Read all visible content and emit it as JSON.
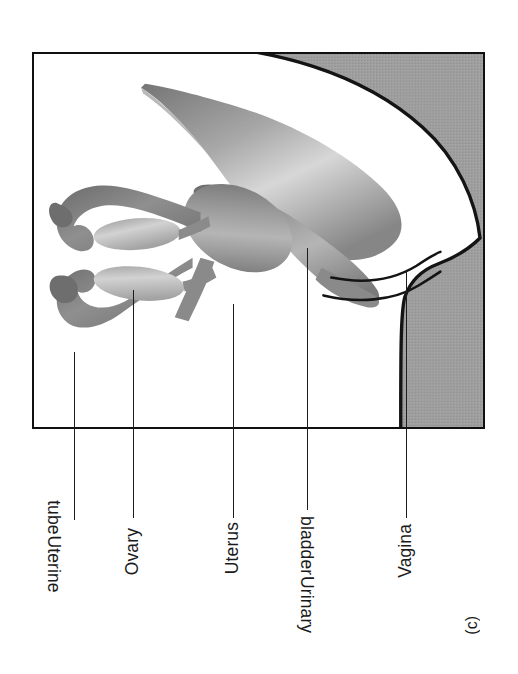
{
  "figure": {
    "caption": "(c)",
    "panel_border_color": "#101010",
    "background_color": "#ffffff",
    "body_region_color": "#9c9c9c",
    "organ_dark_color": "#7d7d7d",
    "organ_mid_color": "#9a9a9a",
    "organ_light_color": "#c9c9c9",
    "outline_color": "#141414"
  },
  "labels": [
    {
      "id": "uterine-tube",
      "line1": "Uterine",
      "line2": "tube",
      "text": "Uterine tube"
    },
    {
      "id": "ovary",
      "line1": "Ovary",
      "line2": "",
      "text": "Ovary"
    },
    {
      "id": "uterus",
      "line1": "Uterus",
      "line2": "",
      "text": "Uterus"
    },
    {
      "id": "urinary-bladder",
      "line1": "Urinary",
      "line2": "bladder",
      "text": "Urinary bladder"
    },
    {
      "id": "vagina",
      "line1": "Vagina",
      "line2": "",
      "text": "Vagina"
    }
  ],
  "structures": [
    {
      "id": "uterine-tube",
      "name": "Uterine tube"
    },
    {
      "id": "ovary",
      "name": "Ovary"
    },
    {
      "id": "uterus",
      "name": "Uterus"
    },
    {
      "id": "urinary-bladder",
      "name": "Urinary bladder"
    },
    {
      "id": "vagina",
      "name": "Vagina"
    },
    {
      "id": "body-wall",
      "name": "Body wall"
    }
  ]
}
